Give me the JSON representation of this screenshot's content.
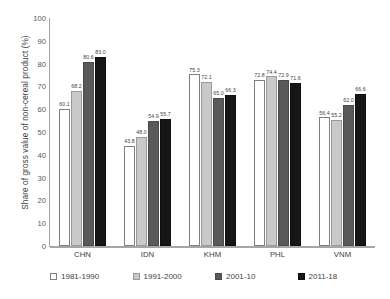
{
  "chart_data": {
    "type": "bar",
    "title": "",
    "xlabel": "",
    "ylabel": "Share of gross value of non-cereal product (%)",
    "ylim": [
      0,
      100
    ],
    "ytick_labels": [
      "100",
      "90",
      "80",
      "70",
      "60",
      "50",
      "40",
      "30",
      "20",
      "10",
      "0"
    ],
    "ytick_values": [
      100,
      90,
      80,
      70,
      60,
      50,
      40,
      30,
      20,
      10,
      0
    ],
    "grid": false,
    "legend_position": "bottom",
    "categories": [
      "CHN",
      "IDN",
      "KHM",
      "PHL",
      "VNM"
    ],
    "series": [
      {
        "name": "1981-1990",
        "color": "#ffffff",
        "values": [
          60.1,
          43.8,
          75.3,
          72.8,
          56.4
        ],
        "labels": [
          "60.1",
          "43.8",
          "75.3",
          "72.8",
          "56.4"
        ]
      },
      {
        "name": "1991-2000",
        "color": "#c9c9c9",
        "values": [
          68.2,
          48.0,
          72.1,
          74.4,
          55.2
        ],
        "labels": [
          "68.2",
          "48.0",
          "72.1",
          "74.4",
          "55.2"
        ]
      },
      {
        "name": "2001-10",
        "color": "#595959",
        "values": [
          80.6,
          54.9,
          65.0,
          72.9,
          62.0
        ],
        "labels": [
          "80.6",
          "54.9",
          "65.0",
          "72.9",
          "62.0"
        ]
      },
      {
        "name": "2011-18",
        "color": "#161616",
        "values": [
          83.0,
          55.7,
          66.3,
          71.6,
          66.6
        ],
        "labels": [
          "83.0",
          "55.7",
          "66.3",
          "71.6",
          "66.6"
        ]
      }
    ]
  },
  "axis": {
    "y_title": "Share of gross value of non-cereal product (%)"
  }
}
